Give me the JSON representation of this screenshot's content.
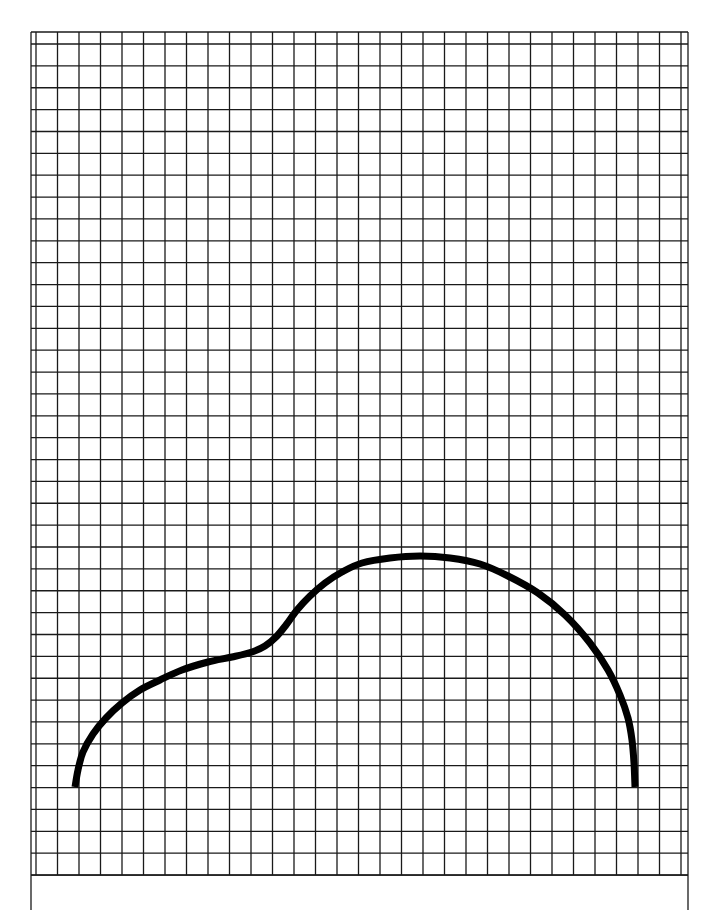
{
  "figure": {
    "title": "",
    "background": "#ffffff",
    "grid": {
      "color": "#1a1a1a",
      "line_width": 1.3,
      "border": {
        "left": 31,
        "top": 32,
        "right": 688,
        "bottom": 875
      },
      "side_rules_extend_to": 910,
      "vertical_lines": {
        "start": 36,
        "spacing": 21.5,
        "count": 31
      },
      "horizontal_lines": {
        "start": 44,
        "spacing": 21.87,
        "count": 39
      }
    },
    "curve": {
      "color": "#000000",
      "stroke_width": 7,
      "points": [
        [
          75,
          787
        ],
        [
          78,
          770
        ],
        [
          83,
          752
        ],
        [
          93,
          734
        ],
        [
          106,
          718
        ],
        [
          122,
          703
        ],
        [
          140,
          690
        ],
        [
          160,
          680
        ],
        [
          182,
          670
        ],
        [
          208,
          662
        ],
        [
          232,
          657
        ],
        [
          252,
          652
        ],
        [
          265,
          646
        ],
        [
          276,
          637
        ],
        [
          286,
          625
        ],
        [
          297,
          610
        ],
        [
          310,
          596
        ],
        [
          325,
          583
        ],
        [
          342,
          572
        ],
        [
          362,
          563
        ],
        [
          390,
          558
        ],
        [
          420,
          556
        ],
        [
          450,
          558
        ],
        [
          480,
          564
        ],
        [
          508,
          576
        ],
        [
          538,
          593
        ],
        [
          565,
          615
        ],
        [
          590,
          643
        ],
        [
          608,
          670
        ],
        [
          620,
          695
        ],
        [
          628,
          718
        ],
        [
          632,
          740
        ],
        [
          634,
          763
        ],
        [
          635,
          787
        ]
      ]
    }
  }
}
